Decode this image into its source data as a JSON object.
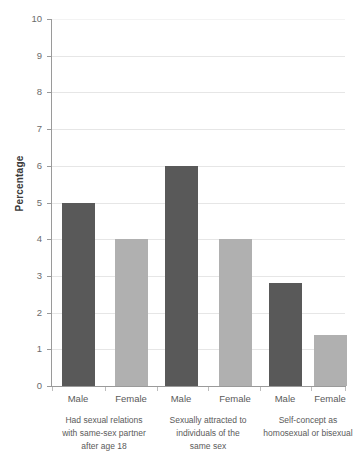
{
  "chart_data": {
    "type": "bar",
    "title": "",
    "xlabel": "",
    "ylabel": "Percentage",
    "ylim": [
      0,
      10
    ],
    "ytick_labels": [
      "10",
      "9",
      "8",
      "7",
      "6",
      "5",
      "4",
      "3",
      "2",
      "1",
      "0"
    ],
    "ytick_values": [
      10,
      9,
      8,
      7,
      6,
      5,
      4,
      3,
      2,
      1,
      0
    ],
    "grid": true,
    "legend": "none",
    "categories": [
      "Had sexual relations with same-sex partner after age 18",
      "Sexually attracted to individuals of the same sex",
      "Self-concept as homosexual or bisexual"
    ],
    "subcategories": [
      "Male",
      "Female"
    ],
    "series": [
      {
        "name": "Male",
        "color": "#595959",
        "values": [
          5.0,
          6.0,
          2.8
        ]
      },
      {
        "name": "Female",
        "color": "#b0b0b0",
        "values": [
          4.0,
          4.0,
          1.4
        ]
      }
    ],
    "bars": [
      {
        "group": 0,
        "sex": "Male",
        "label": "Male",
        "value": 5.0
      },
      {
        "group": 0,
        "sex": "Female",
        "label": "Female",
        "value": 4.0
      },
      {
        "group": 1,
        "sex": "Male",
        "label": "Male",
        "value": 6.0
      },
      {
        "group": 1,
        "sex": "Female",
        "label": "Female",
        "value": 4.0
      },
      {
        "group": 2,
        "sex": "Male",
        "label": "Male",
        "value": 2.8
      },
      {
        "group": 2,
        "sex": "Female",
        "label": "Female",
        "value": 1.4
      }
    ],
    "group_label_lines": [
      [
        "Had sexual relations",
        "with same-sex partner",
        "after age 18"
      ],
      [
        "Sexually attracted to",
        "individuals of the",
        "same sex"
      ],
      [
        "Self-concept as",
        "homosexual or bisexual"
      ]
    ]
  },
  "axis": {
    "y_title": "Percentage"
  },
  "bar_labels": {
    "b0": "Male",
    "b1": "Female",
    "b2": "Male",
    "b3": "Female",
    "b4": "Male",
    "b5": "Female"
  },
  "ytick": {
    "t0": "10",
    "t1": "9",
    "t2": "8",
    "t3": "7",
    "t4": "6",
    "t5": "5",
    "t6": "4",
    "t7": "3",
    "t8": "2",
    "t9": "1",
    "t10": "0"
  },
  "group_labels": {
    "g0l0": "Had sexual relations",
    "g0l1": "with same-sex partner",
    "g0l2": "after age 18",
    "g1l0": "Sexually attracted to",
    "g1l1": "individuals of the",
    "g1l2": "same sex",
    "g2l0": "Self-concept as",
    "g2l1": "homosexual or bisexual"
  },
  "colors": {
    "male_bar": "#595959",
    "female_bar": "#b0b0b0",
    "grid": "#e6e6e6",
    "axis": "#9a9a9a"
  }
}
